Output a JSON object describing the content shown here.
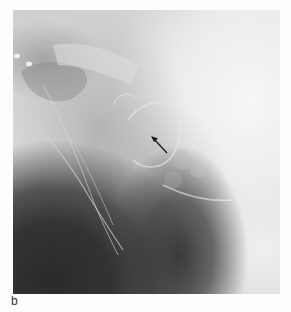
{
  "figure": {
    "panel_label": "b",
    "image_type": "radiograph",
    "annotation": {
      "type": "arrow",
      "direction": "up-left",
      "color": "#1a1a1a"
    },
    "colors": {
      "background": "#ffffff",
      "dark_region": "#2b2b2b",
      "bright_region": "#f2f2f2"
    }
  }
}
